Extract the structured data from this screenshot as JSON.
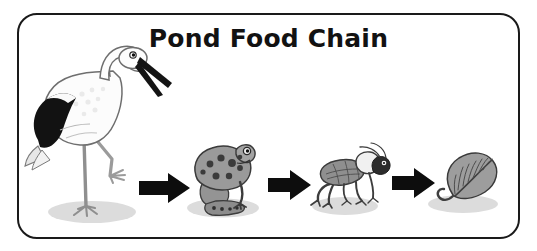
{
  "poster": {
    "title": "Pond Food Chain",
    "background_color": "#ffffff",
    "border_color": "#1a1a1a",
    "title_color": "#121212",
    "shadow_color": "#d9d9d9"
  },
  "chain": {
    "direction": "right",
    "arrow_label": "is eaten by / eats",
    "arrow_color": "#0d0d0d",
    "organisms": [
      {
        "name": "stork",
        "label": "Stork",
        "role": "tertiary consumer",
        "icon": "stork-icon",
        "colors": {
          "body": "#fdfdfd",
          "wing": "#141414",
          "beak": "#141414",
          "leg": "#c9c9c9",
          "outline": "#4a4a4a"
        }
      },
      {
        "name": "frog",
        "label": "Frog",
        "role": "secondary consumer",
        "icon": "frog-icon",
        "colors": {
          "body": "#9a9a9a",
          "spots": "#3b3b3b",
          "outline": "#3a3a3a"
        }
      },
      {
        "name": "cricket",
        "label": "Cricket",
        "role": "primary consumer",
        "icon": "cricket-icon",
        "colors": {
          "body": "#8f8f8f",
          "head": "#2e2e2e",
          "outline": "#3a3a3a"
        }
      },
      {
        "name": "leaf",
        "label": "Leaf",
        "role": "producer",
        "icon": "leaf-icon",
        "colors": {
          "blade": "#9d9d9d",
          "veins": "#4a4a4a",
          "stem": "#4a4a4a",
          "outline": "#3a3a3a"
        }
      }
    ],
    "arrows": [
      {
        "name": "arrow-stork-frog",
        "from": "stork",
        "to": "frog"
      },
      {
        "name": "arrow-frog-cricket",
        "from": "frog",
        "to": "cricket"
      },
      {
        "name": "arrow-cricket-leaf",
        "from": "cricket",
        "to": "leaf"
      }
    ]
  }
}
